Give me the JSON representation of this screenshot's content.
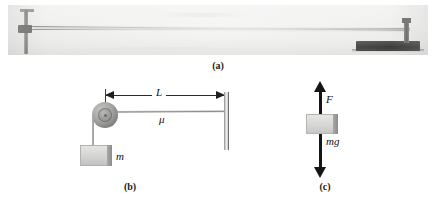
{
  "figure": {
    "panels": [
      {
        "id": "a",
        "caption": "(a)",
        "type": "photograph",
        "description": "standing-wave-on-string-apparatus-photo"
      },
      {
        "id": "b",
        "caption": "(b)",
        "type": "schematic-diagram",
        "labels": {
          "length": "L",
          "linear_density": "μ",
          "mass": "m"
        }
      },
      {
        "id": "c",
        "caption": "(c)",
        "type": "free-body-diagram",
        "labels": {
          "tension_force": "F",
          "weight_force": "mg"
        }
      }
    ]
  },
  "colors": {
    "ink": "#151513",
    "photo_background": "#ececea",
    "apparatus_dark": "#1a1a18",
    "block_fill": "#d8d8d6",
    "string": "#9a9a98"
  }
}
